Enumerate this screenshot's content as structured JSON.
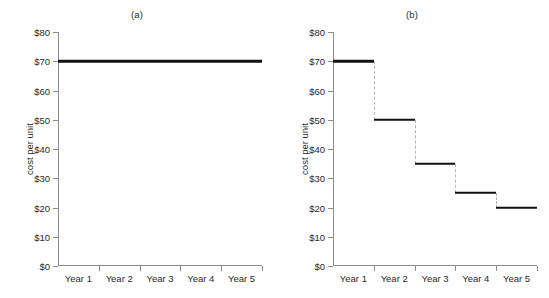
{
  "chart_data": [
    {
      "type": "line",
      "panel": "a",
      "title": "(a)",
      "xlabel": "",
      "ylabel": "cost per unit",
      "categories": [
        "Year 1",
        "Year 2",
        "Year 3",
        "Year 4",
        "Year 5"
      ],
      "ytick_labels": [
        "$0",
        "$10",
        "$20",
        "$30",
        "$40",
        "$50",
        "$60",
        "$70",
        "$80"
      ],
      "ytick_values": [
        0,
        10,
        20,
        30,
        40,
        50,
        60,
        70,
        80
      ],
      "ylim": [
        0,
        80
      ],
      "grid": false,
      "legend": false,
      "series": [
        {
          "name": "cost per unit",
          "style": "solid",
          "color": "#111111",
          "values": [
            70,
            70,
            70,
            70,
            70
          ]
        }
      ]
    },
    {
      "type": "line",
      "panel": "b",
      "title": "(b)",
      "xlabel": "",
      "ylabel": "cost per unit",
      "categories": [
        "Year 1",
        "Year 2",
        "Year 3",
        "Year 4",
        "Year 5"
      ],
      "ytick_labels": [
        "$0",
        "$10",
        "$20",
        "$30",
        "$40",
        "$50",
        "$60",
        "$70",
        "$80"
      ],
      "ytick_values": [
        0,
        10,
        20,
        30,
        40,
        50,
        60,
        70,
        80
      ],
      "ylim": [
        0,
        80
      ],
      "grid": false,
      "legend": false,
      "series": [
        {
          "name": "cost per unit",
          "style": "step",
          "color": "#111111",
          "connector_color": "#b4b4b4",
          "connector_style": "dashed",
          "values": [
            70,
            50,
            35,
            25,
            20
          ]
        }
      ]
    }
  ]
}
